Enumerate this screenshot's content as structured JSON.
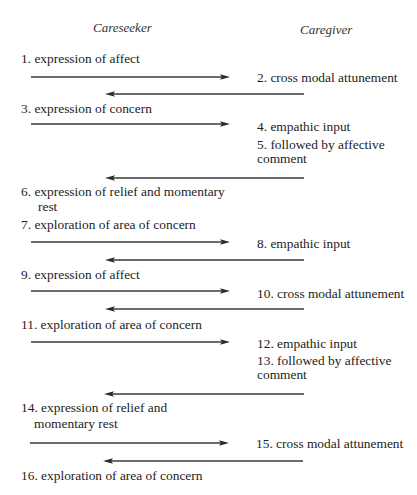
{
  "headers": {
    "careseeker": "Careseeker",
    "caregiver": "Caregiver"
  },
  "careseeker_steps": [
    {
      "n": "1",
      "text": "1. expression of affect",
      "lines": [
        "1. expression of affect"
      ]
    },
    {
      "n": "3",
      "text": "3. expression of concern",
      "lines": [
        "3. expression of concern"
      ]
    },
    {
      "n": "6",
      "text": "6. expression of relief and momentary rest",
      "lines": [
        "6. expression of relief and momentary",
        "rest"
      ]
    },
    {
      "n": "7",
      "text": "7. exploration of area of concern",
      "lines": [
        "7. exploration of area of concern"
      ]
    },
    {
      "n": "9",
      "text": "9. expression of affect",
      "lines": [
        "9. expression of affect"
      ]
    },
    {
      "n": "11",
      "text": "11. exploration of area of concern",
      "lines": [
        "11. exploration of area of concern"
      ]
    },
    {
      "n": "14",
      "text": "14. expression of relief and momentary rest",
      "lines": [
        "14. expression of relief and",
        "momentary rest"
      ]
    },
    {
      "n": "16",
      "text": "16. exploration of area of concern",
      "lines": [
        "16. exploration of area of concern"
      ]
    }
  ],
  "caregiver_steps": [
    {
      "n": "2",
      "text": "2. cross modal attunement",
      "lines": [
        "2. cross modal attunement"
      ]
    },
    {
      "n": "4",
      "text": "4. empathic input",
      "lines": [
        "4. empathic input"
      ]
    },
    {
      "n": "5",
      "text": "5. followed by affective comment",
      "lines": [
        "5. followed by affective",
        "comment"
      ]
    },
    {
      "n": "8",
      "text": "8. empathic input",
      "lines": [
        "8. empathic input"
      ]
    },
    {
      "n": "10",
      "text": "10. cross modal attunement",
      "lines": [
        "10. cross modal attunement"
      ]
    },
    {
      "n": "12",
      "text": "12. empathic input",
      "lines": [
        "12. empathic input"
      ]
    },
    {
      "n": "13",
      "text": "13. followed by affective comment",
      "lines": [
        "13. followed by affective",
        "comment"
      ]
    },
    {
      "n": "15",
      "text": "15. cross modal attunement",
      "lines": [
        "15. cross modal attunement"
      ]
    }
  ],
  "arrows": [
    {
      "direction": "right",
      "from": "careseeker",
      "to": "caregiver",
      "y": 77,
      "x1": 31,
      "x2": 230
    },
    {
      "direction": "left",
      "from": "caregiver",
      "to": "careseeker",
      "y": 94,
      "x1": 304,
      "x2": 105
    },
    {
      "direction": "right",
      "from": "careseeker",
      "to": "caregiver",
      "y": 124,
      "x1": 31,
      "x2": 230
    },
    {
      "direction": "left",
      "from": "caregiver",
      "to": "careseeker",
      "y": 178,
      "x1": 304,
      "x2": 105
    },
    {
      "direction": "right",
      "from": "careseeker",
      "to": "caregiver",
      "y": 242,
      "x1": 31,
      "x2": 230
    },
    {
      "direction": "left",
      "from": "caregiver",
      "to": "careseeker",
      "y": 260,
      "x1": 304,
      "x2": 105
    },
    {
      "direction": "right",
      "from": "careseeker",
      "to": "caregiver",
      "y": 291,
      "x1": 31,
      "x2": 230
    },
    {
      "direction": "left",
      "from": "caregiver",
      "to": "careseeker",
      "y": 309,
      "x1": 304,
      "x2": 105
    },
    {
      "direction": "right",
      "from": "careseeker",
      "to": "caregiver",
      "y": 342,
      "x1": 31,
      "x2": 230
    },
    {
      "direction": "left",
      "from": "caregiver",
      "to": "careseeker",
      "y": 394,
      "x1": 304,
      "x2": 104
    },
    {
      "direction": "right",
      "from": "careseeker",
      "to": "caregiver",
      "y": 443,
      "x1": 30,
      "x2": 229
    },
    {
      "direction": "left",
      "from": "caregiver",
      "to": "careseeker",
      "y": 461,
      "x1": 303,
      "x2": 103
    }
  ],
  "colors": {
    "text": "#232323",
    "arrow": "#3a3a3a",
    "background": "#ffffff"
  }
}
